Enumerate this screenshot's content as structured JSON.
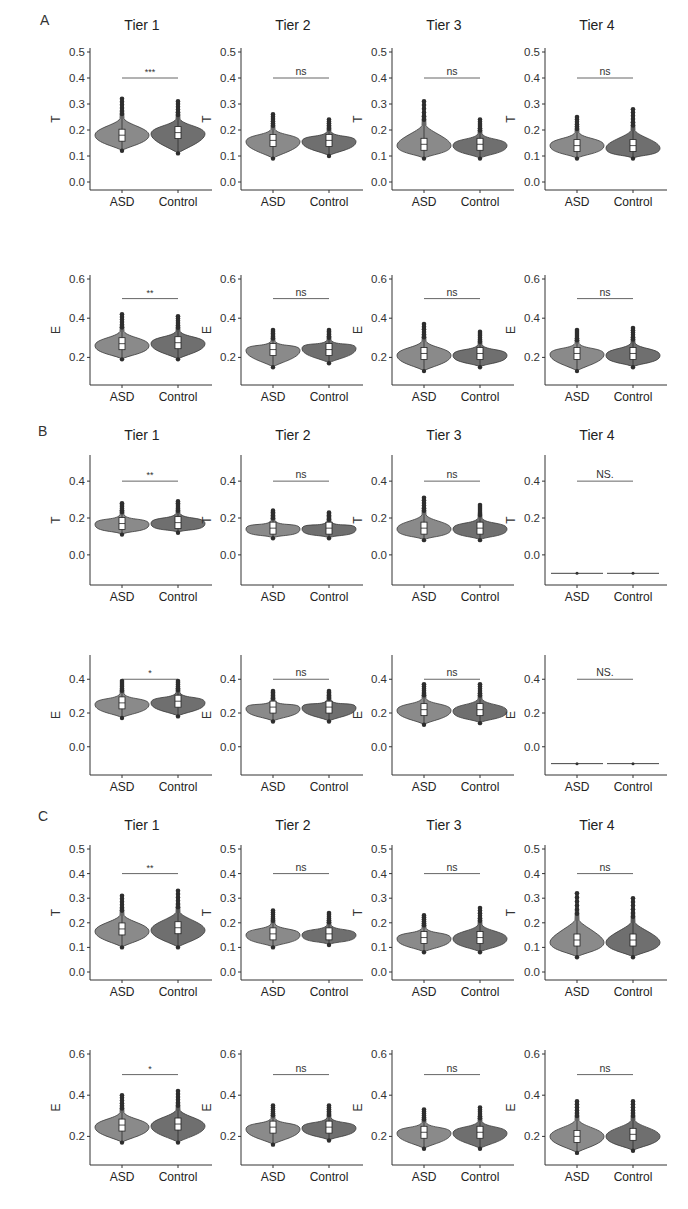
{
  "figure": {
    "sections": [
      {
        "label": "A",
        "x": 40,
        "y": 22
      },
      {
        "label": "B",
        "x": 40,
        "y": 433
      },
      {
        "label": "C",
        "x": 40,
        "y": 818
      }
    ],
    "columns": [
      {
        "title": "Tier 1"
      },
      {
        "title": "Tier 2"
      },
      {
        "title": "Tier 3"
      },
      {
        "title": "Tier 4"
      }
    ],
    "groups": [
      "ASD",
      "Control"
    ],
    "colors": {
      "asd_fill": "#8a8a8a",
      "control_fill": "#6f6f6f",
      "outline": "#3a3a3a",
      "axis": "#333333",
      "box": "#ffffff"
    }
  },
  "chart_data": [
    {
      "type": "violin",
      "panel": "A",
      "tier": "Tier 1",
      "ylabel": "T",
      "ylim": [
        0.0,
        0.5
      ],
      "yticks": [
        "0.0",
        "0.1",
        "0.2",
        "0.3",
        "0.4",
        "0.5"
      ],
      "categories": [
        "ASD",
        "Control"
      ],
      "significance": "***",
      "sig_y": 0.4,
      "series": [
        {
          "name": "ASD",
          "min": 0.12,
          "max": 0.32,
          "median": 0.18,
          "mode": 0.18,
          "outliers_top": 0.32
        },
        {
          "name": "Control",
          "min": 0.11,
          "max": 0.31,
          "median": 0.19,
          "mode": 0.185
        }
      ]
    },
    {
      "type": "violin",
      "panel": "A",
      "tier": "Tier 2",
      "ylabel": "T",
      "ylim": [
        0.0,
        0.5
      ],
      "yticks": [
        "0.0",
        "0.1",
        "0.2",
        "0.3",
        "0.4",
        "0.5"
      ],
      "categories": [
        "ASD",
        "Control"
      ],
      "significance": "ns",
      "sig_y": 0.4,
      "series": [
        {
          "name": "ASD",
          "min": 0.09,
          "max": 0.26,
          "median": 0.16,
          "mode": 0.155
        },
        {
          "name": "Control",
          "min": 0.1,
          "max": 0.24,
          "median": 0.16,
          "mode": 0.155
        }
      ]
    },
    {
      "type": "violin",
      "panel": "A",
      "tier": "Tier 3",
      "ylabel": "T",
      "ylim": [
        0.0,
        0.5
      ],
      "yticks": [
        "0.0",
        "0.1",
        "0.2",
        "0.3",
        "0.4",
        "0.5"
      ],
      "categories": [
        "ASD",
        "Control"
      ],
      "significance": "ns",
      "sig_y": 0.4,
      "series": [
        {
          "name": "ASD",
          "min": 0.09,
          "max": 0.31,
          "median": 0.145,
          "mode": 0.14
        },
        {
          "name": "Control",
          "min": 0.09,
          "max": 0.24,
          "median": 0.145,
          "mode": 0.14
        }
      ]
    },
    {
      "type": "violin",
      "panel": "A",
      "tier": "Tier 4",
      "ylabel": "T",
      "ylim": [
        0.0,
        0.5
      ],
      "yticks": [
        "0.0",
        "0.1",
        "0.2",
        "0.3",
        "0.4",
        "0.5"
      ],
      "categories": [
        "ASD",
        "Control"
      ],
      "significance": "ns",
      "sig_y": 0.4,
      "series": [
        {
          "name": "ASD",
          "min": 0.09,
          "max": 0.25,
          "median": 0.14,
          "mode": 0.14
        },
        {
          "name": "Control",
          "min": 0.09,
          "max": 0.28,
          "median": 0.14,
          "mode": 0.13
        }
      ]
    },
    {
      "type": "violin",
      "panel": "A",
      "tier": "Tier 1",
      "ylabel": "E",
      "ylim": [
        0.1,
        0.6
      ],
      "yticks": [
        "0.2",
        "0.4",
        "0.6"
      ],
      "categories": [
        "ASD",
        "Control"
      ],
      "significance": "**",
      "sig_y": 0.5,
      "series": [
        {
          "name": "ASD",
          "min": 0.19,
          "max": 0.42,
          "median": 0.27,
          "mode": 0.26
        },
        {
          "name": "Control",
          "min": 0.19,
          "max": 0.41,
          "median": 0.275,
          "mode": 0.27
        }
      ]
    },
    {
      "type": "violin",
      "panel": "A",
      "tier": "Tier 2",
      "ylabel": "E",
      "ylim": [
        0.1,
        0.6
      ],
      "yticks": [
        "0.2",
        "0.4",
        "0.6"
      ],
      "categories": [
        "ASD",
        "Control"
      ],
      "significance": "ns",
      "sig_y": 0.5,
      "series": [
        {
          "name": "ASD",
          "min": 0.15,
          "max": 0.34,
          "median": 0.24,
          "mode": 0.235
        },
        {
          "name": "Control",
          "min": 0.17,
          "max": 0.34,
          "median": 0.24,
          "mode": 0.245
        }
      ]
    },
    {
      "type": "violin",
      "panel": "A",
      "tier": "Tier 3",
      "ylabel": "E",
      "ylim": [
        0.1,
        0.6
      ],
      "yticks": [
        "0.2",
        "0.4",
        "0.6"
      ],
      "categories": [
        "ASD",
        "Control"
      ],
      "significance": "ns",
      "sig_y": 0.5,
      "series": [
        {
          "name": "ASD",
          "min": 0.13,
          "max": 0.37,
          "median": 0.22,
          "mode": 0.21
        },
        {
          "name": "Control",
          "min": 0.15,
          "max": 0.33,
          "median": 0.22,
          "mode": 0.21
        }
      ]
    },
    {
      "type": "violin",
      "panel": "A",
      "tier": "Tier 4",
      "ylabel": "E",
      "ylim": [
        0.1,
        0.6
      ],
      "yticks": [
        "0.2",
        "0.4",
        "0.6"
      ],
      "categories": [
        "ASD",
        "Control"
      ],
      "significance": "ns",
      "sig_y": 0.5,
      "series": [
        {
          "name": "ASD",
          "min": 0.13,
          "max": 0.34,
          "median": 0.22,
          "mode": 0.215
        },
        {
          "name": "Control",
          "min": 0.15,
          "max": 0.35,
          "median": 0.22,
          "mode": 0.21
        }
      ]
    },
    {
      "type": "violin",
      "panel": "B",
      "tier": "Tier 1",
      "ylabel": "T",
      "ylim": [
        -0.12,
        0.52
      ],
      "yticks": [
        "0.0",
        "0.2",
        "0.4"
      ],
      "categories": [
        "ASD",
        "Control"
      ],
      "significance": "**",
      "sig_y": 0.4,
      "series": [
        {
          "name": "ASD",
          "min": 0.11,
          "max": 0.28,
          "median": 0.17,
          "mode": 0.165
        },
        {
          "name": "Control",
          "min": 0.12,
          "max": 0.29,
          "median": 0.175,
          "mode": 0.17
        }
      ]
    },
    {
      "type": "violin",
      "panel": "B",
      "tier": "Tier 2",
      "ylabel": "T",
      "ylim": [
        -0.12,
        0.52
      ],
      "yticks": [
        "0.0",
        "0.2",
        "0.4"
      ],
      "categories": [
        "ASD",
        "Control"
      ],
      "significance": "ns",
      "sig_y": 0.4,
      "series": [
        {
          "name": "ASD",
          "min": 0.09,
          "max": 0.24,
          "median": 0.145,
          "mode": 0.14
        },
        {
          "name": "Control",
          "min": 0.09,
          "max": 0.23,
          "median": 0.145,
          "mode": 0.14
        }
      ]
    },
    {
      "type": "violin",
      "panel": "B",
      "tier": "Tier 3",
      "ylabel": "T",
      "ylim": [
        -0.12,
        0.52
      ],
      "yticks": [
        "0.0",
        "0.2",
        "0.4"
      ],
      "categories": [
        "ASD",
        "Control"
      ],
      "significance": "ns",
      "sig_y": 0.4,
      "series": [
        {
          "name": "ASD",
          "min": 0.08,
          "max": 0.31,
          "median": 0.145,
          "mode": 0.14
        },
        {
          "name": "Control",
          "min": 0.08,
          "max": 0.27,
          "median": 0.145,
          "mode": 0.14
        }
      ]
    },
    {
      "type": "violin",
      "panel": "B",
      "tier": "Tier 4",
      "ylabel": "T",
      "ylim": [
        -0.12,
        0.52
      ],
      "yticks": [
        "0.0",
        "0.2",
        "0.4"
      ],
      "categories": [
        "ASD",
        "Control"
      ],
      "significance": "NS.",
      "sig_y": 0.4,
      "series": [
        {
          "name": "ASD",
          "min": -0.1,
          "max": -0.1,
          "median": -0.1,
          "mode": -0.1
        },
        {
          "name": "Control",
          "min": -0.1,
          "max": -0.1,
          "median": -0.1,
          "mode": -0.1
        }
      ]
    },
    {
      "type": "violin",
      "panel": "B",
      "tier": "Tier 1",
      "ylabel": "E",
      "ylim": [
        -0.12,
        0.52
      ],
      "yticks": [
        "0.0",
        "0.2",
        "0.4"
      ],
      "categories": [
        "ASD",
        "Control"
      ],
      "significance": "*",
      "sig_y": 0.4,
      "series": [
        {
          "name": "ASD",
          "min": 0.17,
          "max": 0.39,
          "median": 0.26,
          "mode": 0.25
        },
        {
          "name": "Control",
          "min": 0.18,
          "max": 0.39,
          "median": 0.27,
          "mode": 0.26
        }
      ]
    },
    {
      "type": "violin",
      "panel": "B",
      "tier": "Tier 2",
      "ylabel": "E",
      "ylim": [
        -0.12,
        0.52
      ],
      "yticks": [
        "0.0",
        "0.2",
        "0.4"
      ],
      "categories": [
        "ASD",
        "Control"
      ],
      "significance": "ns",
      "sig_y": 0.4,
      "series": [
        {
          "name": "ASD",
          "min": 0.15,
          "max": 0.33,
          "median": 0.235,
          "mode": 0.225
        },
        {
          "name": "Control",
          "min": 0.15,
          "max": 0.33,
          "median": 0.235,
          "mode": 0.23
        }
      ]
    },
    {
      "type": "violin",
      "panel": "B",
      "tier": "Tier 3",
      "ylabel": "E",
      "ylim": [
        -0.12,
        0.52
      ],
      "yticks": [
        "0.0",
        "0.2",
        "0.4"
      ],
      "categories": [
        "ASD",
        "Control"
      ],
      "significance": "ns",
      "sig_y": 0.4,
      "series": [
        {
          "name": "ASD",
          "min": 0.13,
          "max": 0.37,
          "median": 0.22,
          "mode": 0.215
        },
        {
          "name": "Control",
          "min": 0.14,
          "max": 0.37,
          "median": 0.22,
          "mode": 0.21
        }
      ]
    },
    {
      "type": "violin",
      "panel": "B",
      "tier": "Tier 4",
      "ylabel": "E",
      "ylim": [
        -0.12,
        0.52
      ],
      "yticks": [
        "0.0",
        "0.2",
        "0.4"
      ],
      "categories": [
        "ASD",
        "Control"
      ],
      "significance": "NS.",
      "sig_y": 0.4,
      "series": [
        {
          "name": "ASD",
          "min": -0.1,
          "max": -0.1,
          "median": -0.1,
          "mode": -0.1
        },
        {
          "name": "Control",
          "min": -0.1,
          "max": -0.1,
          "median": -0.1,
          "mode": -0.1
        }
      ]
    },
    {
      "type": "violin",
      "panel": "C",
      "tier": "Tier 1",
      "ylabel": "T",
      "ylim": [
        0.0,
        0.5
      ],
      "yticks": [
        "0.0",
        "0.1",
        "0.2",
        "0.3",
        "0.4",
        "0.5"
      ],
      "categories": [
        "ASD",
        "Control"
      ],
      "significance": "**",
      "sig_y": 0.4,
      "series": [
        {
          "name": "ASD",
          "min": 0.1,
          "max": 0.31,
          "median": 0.175,
          "mode": 0.165
        },
        {
          "name": "Control",
          "min": 0.1,
          "max": 0.33,
          "median": 0.18,
          "mode": 0.17
        }
      ]
    },
    {
      "type": "violin",
      "panel": "C",
      "tier": "Tier 2",
      "ylabel": "T",
      "ylim": [
        0.0,
        0.5
      ],
      "yticks": [
        "0.0",
        "0.1",
        "0.2",
        "0.3",
        "0.4",
        "0.5"
      ],
      "categories": [
        "ASD",
        "Control"
      ],
      "significance": "ns",
      "sig_y": 0.4,
      "series": [
        {
          "name": "ASD",
          "min": 0.1,
          "max": 0.25,
          "median": 0.155,
          "mode": 0.15
        },
        {
          "name": "Control",
          "min": 0.11,
          "max": 0.24,
          "median": 0.155,
          "mode": 0.15
        }
      ]
    },
    {
      "type": "violin",
      "panel": "C",
      "tier": "Tier 3",
      "ylabel": "T",
      "ylim": [
        0.0,
        0.5
      ],
      "yticks": [
        "0.0",
        "0.1",
        "0.2",
        "0.3",
        "0.4",
        "0.5"
      ],
      "categories": [
        "ASD",
        "Control"
      ],
      "significance": "ns",
      "sig_y": 0.4,
      "series": [
        {
          "name": "ASD",
          "min": 0.08,
          "max": 0.23,
          "median": 0.14,
          "mode": 0.135
        },
        {
          "name": "Control",
          "min": 0.08,
          "max": 0.26,
          "median": 0.14,
          "mode": 0.135
        }
      ]
    },
    {
      "type": "violin",
      "panel": "C",
      "tier": "Tier 4",
      "ylabel": "T",
      "ylim": [
        0.0,
        0.5
      ],
      "yticks": [
        "0.0",
        "0.1",
        "0.2",
        "0.3",
        "0.4",
        "0.5"
      ],
      "categories": [
        "ASD",
        "Control"
      ],
      "significance": "ns",
      "sig_y": 0.4,
      "series": [
        {
          "name": "ASD",
          "min": 0.06,
          "max": 0.32,
          "median": 0.13,
          "mode": 0.12
        },
        {
          "name": "Control",
          "min": 0.06,
          "max": 0.3,
          "median": 0.13,
          "mode": 0.12
        }
      ]
    },
    {
      "type": "violin",
      "panel": "C",
      "tier": "Tier 1",
      "ylabel": "E",
      "ylim": [
        0.1,
        0.6
      ],
      "yticks": [
        "0.2",
        "0.4",
        "0.6"
      ],
      "categories": [
        "ASD",
        "Control"
      ],
      "significance": "*",
      "sig_y": 0.5,
      "series": [
        {
          "name": "ASD",
          "min": 0.17,
          "max": 0.4,
          "median": 0.255,
          "mode": 0.245
        },
        {
          "name": "Control",
          "min": 0.17,
          "max": 0.42,
          "median": 0.26,
          "mode": 0.25
        }
      ]
    },
    {
      "type": "violin",
      "panel": "C",
      "tier": "Tier 2",
      "ylabel": "E",
      "ylim": [
        0.1,
        0.6
      ],
      "yticks": [
        "0.2",
        "0.4",
        "0.6"
      ],
      "categories": [
        "ASD",
        "Control"
      ],
      "significance": "ns",
      "sig_y": 0.5,
      "series": [
        {
          "name": "ASD",
          "min": 0.16,
          "max": 0.35,
          "median": 0.245,
          "mode": 0.235
        },
        {
          "name": "Control",
          "min": 0.18,
          "max": 0.35,
          "median": 0.245,
          "mode": 0.24
        }
      ]
    },
    {
      "type": "violin",
      "panel": "C",
      "tier": "Tier 3",
      "ylabel": "E",
      "ylim": [
        0.1,
        0.6
      ],
      "yticks": [
        "0.2",
        "0.4",
        "0.6"
      ],
      "categories": [
        "ASD",
        "Control"
      ],
      "significance": "ns",
      "sig_y": 0.5,
      "series": [
        {
          "name": "ASD",
          "min": 0.14,
          "max": 0.33,
          "median": 0.22,
          "mode": 0.215
        },
        {
          "name": "Control",
          "min": 0.14,
          "max": 0.34,
          "median": 0.22,
          "mode": 0.215
        }
      ]
    },
    {
      "type": "violin",
      "panel": "C",
      "tier": "Tier 4",
      "ylabel": "E",
      "ylim": [
        0.1,
        0.6
      ],
      "yticks": [
        "0.2",
        "0.4",
        "0.6"
      ],
      "categories": [
        "ASD",
        "Control"
      ],
      "significance": "ns",
      "sig_y": 0.5,
      "series": [
        {
          "name": "ASD",
          "min": 0.12,
          "max": 0.37,
          "median": 0.2,
          "mode": 0.2
        },
        {
          "name": "Control",
          "min": 0.13,
          "max": 0.37,
          "median": 0.21,
          "mode": 0.2
        }
      ]
    }
  ]
}
